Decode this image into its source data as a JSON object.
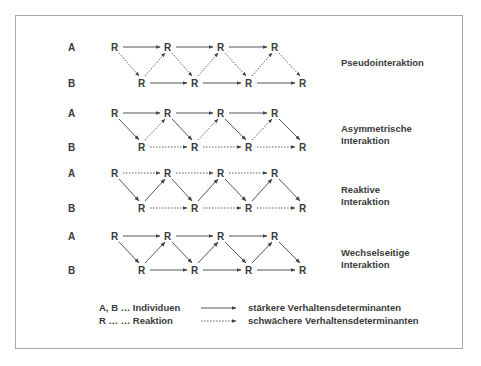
{
  "diagram": {
    "type": "interaction-types",
    "row_labels": {
      "a": "A",
      "b": "B"
    },
    "node_label": "R",
    "panels": [
      {
        "id": "pseudo",
        "title_lines": [
          "Pseudointeraktion"
        ],
        "a_to_a": "solid",
        "b_to_b": "solid",
        "a_to_b": "dotted",
        "b_to_a": "dotted"
      },
      {
        "id": "asymmetric",
        "title_lines": [
          "Asymmetrische",
          "Interaktion"
        ],
        "a_to_a": "solid",
        "b_to_b": "dotted",
        "a_to_b": "solid",
        "b_to_a": "dotted"
      },
      {
        "id": "reactive",
        "title_lines": [
          "Reaktive",
          "Interaktion"
        ],
        "a_to_a": "dotted",
        "b_to_b": "dotted",
        "a_to_b": "solid",
        "b_to_a": "solid"
      },
      {
        "id": "mutual",
        "title_lines": [
          "Wechselseitige",
          "Interaktion"
        ],
        "a_to_a": "solid",
        "b_to_b": "solid",
        "a_to_b": "solid",
        "b_to_a": "solid"
      }
    ],
    "legend": {
      "left": [
        {
          "text": "A, B … Individuen"
        },
        {
          "text": "R … … Reaktion"
        }
      ],
      "right": [
        {
          "style": "solid",
          "text": "stärkere Verhaltensdeterminanten"
        },
        {
          "style": "dotted",
          "text": "schwächere Verhaltensdeterminanten"
        }
      ]
    },
    "colors": {
      "text": "#3a3a3a",
      "arrow": "#555555",
      "frame": "#a8a8a8"
    }
  }
}
